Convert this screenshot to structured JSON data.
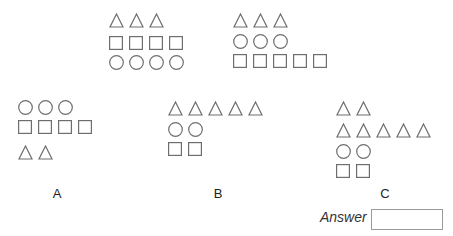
{
  "stroke_color": "#6e6e6e",
  "question_figures": [
    {
      "id": "q1",
      "left": 109,
      "top": 13,
      "rows": [
        {
          "shape": "triangle",
          "count": 3,
          "top": 0
        },
        {
          "shape": "square",
          "count": 4,
          "top": 23
        },
        {
          "shape": "circle",
          "count": 4,
          "top": 42
        }
      ]
    },
    {
      "id": "q2",
      "left": 233,
      "top": 13,
      "rows": [
        {
          "shape": "triangle",
          "count": 3,
          "top": 0
        },
        {
          "shape": "circle",
          "count": 3,
          "top": 21
        },
        {
          "shape": "square",
          "count": 5,
          "top": 41
        }
      ]
    }
  ],
  "options": [
    {
      "label": "A",
      "label_x": 57,
      "left": 18,
      "top": 100,
      "rows": [
        {
          "shape": "circle",
          "count": 3,
          "top": 0
        },
        {
          "shape": "square",
          "count": 4,
          "top": 20
        },
        {
          "shape": "triangle",
          "count": 2,
          "top": 45
        }
      ]
    },
    {
      "label": "B",
      "label_x": 218,
      "left": 168,
      "top": 101,
      "rows": [
        {
          "shape": "triangle",
          "count": 5,
          "top": 0
        },
        {
          "shape": "circle",
          "count": 2,
          "top": 21
        },
        {
          "shape": "square",
          "count": 2,
          "top": 41
        }
      ]
    },
    {
      "label": "C",
      "label_x": 385,
      "left": 336,
      "top": 101,
      "rows": [
        {
          "shape": "triangle",
          "count": 2,
          "top": 0
        },
        {
          "shape": "triangle",
          "count": 5,
          "top": 22
        },
        {
          "shape": "circle",
          "count": 2,
          "top": 43
        },
        {
          "shape": "square",
          "count": 2,
          "top": 63
        }
      ]
    }
  ],
  "option_label_top": 186,
  "answer": {
    "label": "Answer",
    "value": ""
  }
}
